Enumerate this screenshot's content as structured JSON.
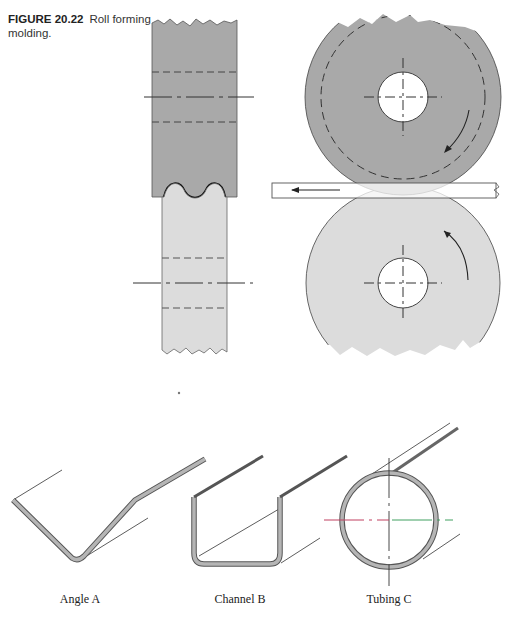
{
  "caption": {
    "figure_number": "FIGURE 20.22",
    "title": "Roll forming molding."
  },
  "diagram": {
    "side_view": {
      "upper_roll": "upper-roll-side",
      "lower_roll": "lower-roll-side"
    },
    "front_view": {
      "upper_roll_rotation": "clockwise-arrow",
      "lower_roll_rotation": "counterclockwise-arrow",
      "strip_direction": "left-arrow"
    },
    "colors": {
      "upper_roll": "#a9a9a9",
      "lower_roll": "#dcdcdc",
      "outline": "#333333",
      "profile_fill": "#b0b0b0"
    }
  },
  "profiles": [
    {
      "label": "Angle A"
    },
    {
      "label": "Channel B"
    },
    {
      "label": "Tubing C"
    }
  ]
}
